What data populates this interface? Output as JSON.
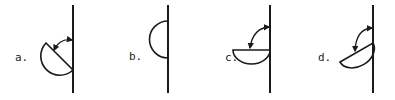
{
  "diagram": {
    "panels": [
      {
        "id": "a",
        "label": "a.",
        "flap_orientation": "diagonal chord, arc lower-left",
        "has_arrow": true
      },
      {
        "id": "b",
        "label": "b.",
        "flap_orientation": "vertical chord on line, arc left",
        "has_arrow": false
      },
      {
        "id": "c",
        "label": "c.",
        "flap_orientation": "horizontal chord, arc below",
        "has_arrow": true
      },
      {
        "id": "d",
        "label": "d.",
        "flap_orientation": "tilted chord, arc below-left",
        "has_arrow": true
      }
    ],
    "colors": {
      "stroke": "#1a1a1a",
      "background": "#ffffff"
    }
  }
}
